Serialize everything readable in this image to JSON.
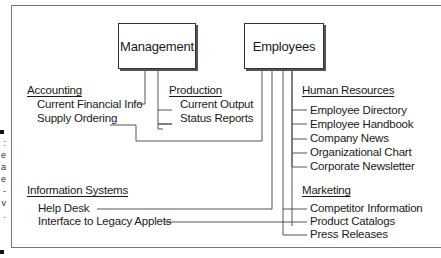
{
  "caption_fragments": [
    ":",
    "e",
    "a",
    "e",
    "-",
    "v",
    "."
  ],
  "boxes": {
    "management": "Management",
    "employees": "Employees"
  },
  "groups": {
    "accounting": {
      "heading": "Accounting",
      "items": [
        "Current Financial Info",
        "Supply Ordering"
      ]
    },
    "production": {
      "heading": "Production",
      "items": [
        "Current Output",
        "Status Reports"
      ]
    },
    "human_resources": {
      "heading": "Human Resources",
      "items": [
        "Employee Directory",
        "Employee Handbook",
        "Company News",
        "Organizational Chart",
        "Corporate Newsletter"
      ]
    },
    "information_systems": {
      "heading": "Information Systems",
      "items": [
        "Help Desk",
        "Interface to Legacy Applets"
      ]
    },
    "marketing": {
      "heading": "Marketing",
      "items": [
        "Competitor Information",
        "Product Catalogs",
        "Press Releases"
      ]
    }
  },
  "colors": {
    "line": "#555555",
    "text": "#1a1a1a",
    "frame": "#777777"
  }
}
